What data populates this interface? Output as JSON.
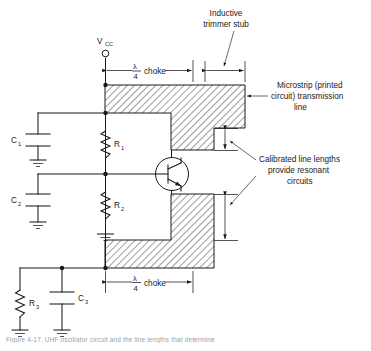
{
  "figure": {
    "type": "circuit-schematic",
    "caption": "Figure  4-17.   UHF  oscillator  circuit  and  the  line  lengths  that  determine",
    "background_color": "#ffffff",
    "ink_color": "#1a1a1a"
  },
  "supply": {
    "label": "V",
    "label_sub": "CC",
    "terminal": "open-circle"
  },
  "components": [
    {
      "id": "C1",
      "label": "C",
      "sub": "1",
      "type": "capacitor"
    },
    {
      "id": "C2",
      "label": "C",
      "sub": "2",
      "type": "capacitor"
    },
    {
      "id": "C3",
      "label": "C",
      "sub": "3",
      "type": "capacitor"
    },
    {
      "id": "R1",
      "label": "R",
      "sub": "1",
      "type": "resistor"
    },
    {
      "id": "R2",
      "label": "R",
      "sub": "2",
      "type": "resistor"
    },
    {
      "id": "R3",
      "label": "R",
      "sub": "3",
      "type": "resistor"
    },
    {
      "id": "Q1",
      "label": "",
      "sub": "",
      "type": "npn-transistor"
    }
  ],
  "dimensions": {
    "choke_top": {
      "numerator": "λ",
      "denominator": "4",
      "text": "choke"
    },
    "choke_bottom": {
      "numerator": "λ",
      "denominator": "4",
      "text": "choke"
    },
    "stub": {
      "text": ""
    },
    "gap_upper": {
      "text": ""
    },
    "gap_lower": {
      "text": ""
    }
  },
  "annotations": {
    "inductive_stub": {
      "line1": "Inductive",
      "line2": "trimmer stub"
    },
    "microstrip": {
      "line1": "Microstrip (printed",
      "line2": "circuit) transmission",
      "line3": "line"
    },
    "calibrated": {
      "line1": "Calibrated line lengths",
      "line2": "provide resonant",
      "line3": "circuits"
    }
  },
  "ground_symbols": 5
}
